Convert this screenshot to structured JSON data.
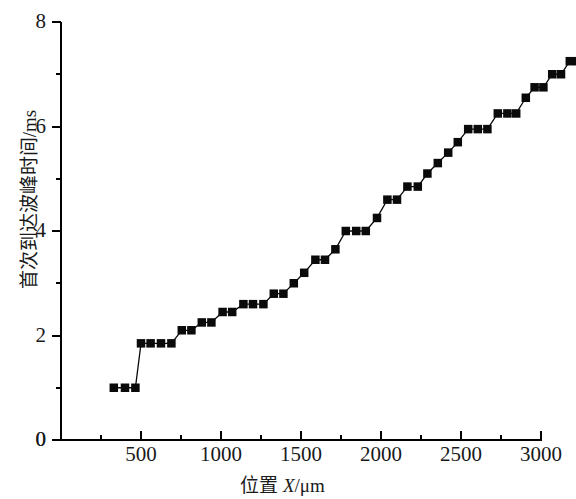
{
  "chart_data": {
    "type": "line",
    "title": "",
    "xlabel": "位置 X/μm",
    "ylabel": "首次到达波峰时间/ms",
    "xlim": [
      0,
      3000
    ],
    "ylim": [
      0,
      8
    ],
    "xticks": [
      0,
      500,
      1000,
      1500,
      2000,
      2500,
      3000
    ],
    "xticklabels": [
      "0",
      "500",
      "1000",
      "1500",
      "2000",
      "2500",
      "3000"
    ],
    "xminorticks": [
      250,
      750,
      1250,
      1750,
      2250,
      2750
    ],
    "yticks": [
      0,
      2,
      4,
      6,
      8
    ],
    "yticklabels": [
      "0",
      "2",
      "4",
      "6",
      "8"
    ],
    "yminorticks": [
      1,
      3,
      5,
      7
    ],
    "grid": false,
    "legend": false,
    "marker": "square",
    "marker_color": "#0a0a0a",
    "line_color": "#0a0a0a",
    "series": [
      {
        "name": "首次到达波峰时间",
        "x": [
          330,
          415,
          500,
          585,
          670,
          755,
          840,
          925,
          1010,
          1095,
          1180,
          1265,
          1350,
          1435,
          1520,
          1605,
          1690,
          1775,
          1860,
          1945,
          2030,
          2115,
          2200,
          2285,
          2370,
          2455,
          2540,
          2625,
          2710,
          2795,
          2880
        ],
        "y": [
          1.0,
          1.0,
          1.0,
          1.85,
          1.85,
          1.85,
          1.85,
          2.1,
          2.2,
          2.4,
          2.4,
          2.6,
          2.6,
          2.8,
          2.8,
          2.8,
          3.05,
          3.05,
          3.25,
          3.45,
          3.6,
          3.95,
          3.95,
          4.15,
          4.4,
          4.4,
          4.4,
          4.65,
          4.9,
          4.9,
          5.15
        ]
      }
    ],
    "points": [
      {
        "x": 330,
        "y": 1.0
      },
      {
        "x": 400,
        "y": 1.0
      },
      {
        "x": 465,
        "y": 1.0
      },
      {
        "x": 500,
        "y": 1.85
      },
      {
        "x": 560,
        "y": 1.85
      },
      {
        "x": 625,
        "y": 1.85
      },
      {
        "x": 690,
        "y": 1.85
      },
      {
        "x": 755,
        "y": 2.1
      },
      {
        "x": 815,
        "y": 2.1
      },
      {
        "x": 880,
        "y": 2.25
      },
      {
        "x": 940,
        "y": 2.25
      },
      {
        "x": 1010,
        "y": 2.45
      },
      {
        "x": 1070,
        "y": 2.45
      },
      {
        "x": 1140,
        "y": 2.6
      },
      {
        "x": 1200,
        "y": 2.6
      },
      {
        "x": 1265,
        "y": 2.6
      },
      {
        "x": 1330,
        "y": 2.8
      },
      {
        "x": 1390,
        "y": 2.8
      },
      {
        "x": 1455,
        "y": 3.0
      },
      {
        "x": 1520,
        "y": 3.2
      },
      {
        "x": 1590,
        "y": 3.45
      },
      {
        "x": 1650,
        "y": 3.45
      },
      {
        "x": 1715,
        "y": 3.65
      },
      {
        "x": 1780,
        "y": 4.0
      },
      {
        "x": 1845,
        "y": 4.0
      },
      {
        "x": 1905,
        "y": 4.0
      },
      {
        "x": 1975,
        "y": 4.25
      },
      {
        "x": 2040,
        "y": 4.6
      },
      {
        "x": 2100,
        "y": 4.6
      },
      {
        "x": 2165,
        "y": 4.85
      },
      {
        "x": 2230,
        "y": 4.85
      },
      {
        "x": 2290,
        "y": 5.1
      },
      {
        "x": 2355,
        "y": 5.3
      },
      {
        "x": 2420,
        "y": 5.5
      },
      {
        "x": 2480,
        "y": 5.7
      },
      {
        "x": 2545,
        "y": 5.95
      },
      {
        "x": 2605,
        "y": 5.95
      },
      {
        "x": 2665,
        "y": 5.95
      },
      {
        "x": 2730,
        "y": 6.25
      },
      {
        "x": 2790,
        "y": 6.25
      },
      {
        "x": 2845,
        "y": 6.25
      },
      {
        "x": 2905,
        "y": 6.55
      },
      {
        "x": 2960,
        "y": 6.75
      },
      {
        "x": 3015,
        "y": 6.75
      },
      {
        "x": 3070,
        "y": 7.0
      },
      {
        "x": 3125,
        "y": 7.0
      },
      {
        "x": 3180,
        "y": 7.25
      },
      {
        "x": 3230,
        "y": 7.25
      }
    ]
  }
}
